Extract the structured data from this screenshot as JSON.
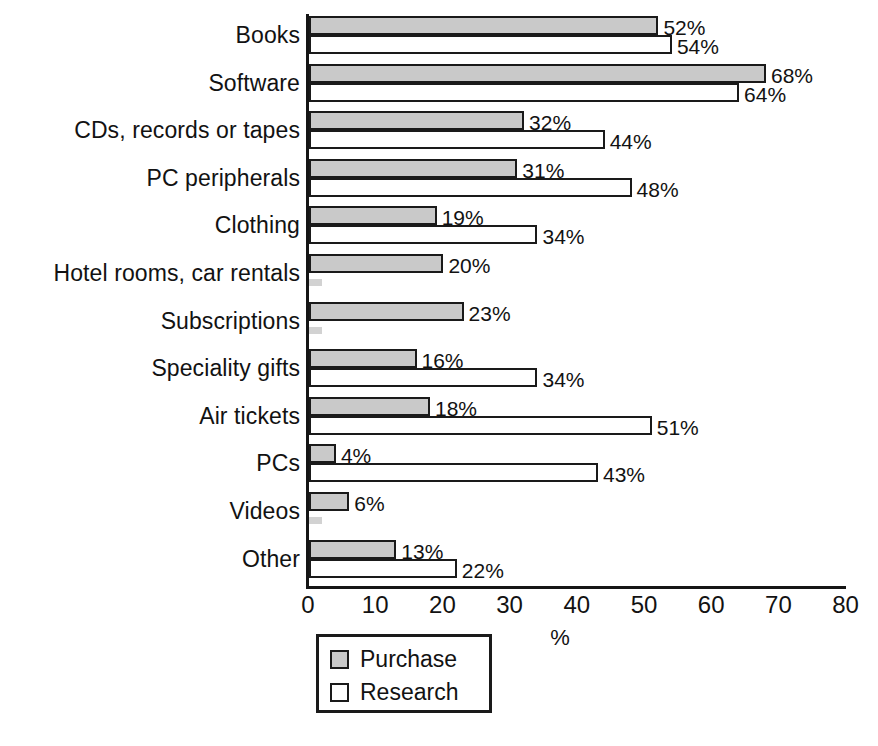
{
  "chart_data": {
    "type": "bar",
    "orientation": "horizontal",
    "title": "",
    "xlabel": "%",
    "ylabel": "",
    "xlim": [
      0,
      80
    ],
    "xticks": [
      "0",
      "10",
      "20",
      "30",
      "40",
      "50",
      "60",
      "70",
      "80"
    ],
    "grid": false,
    "legend_position": "below-axis-left",
    "categories": [
      "Books",
      "Software",
      "CDs, records or tapes",
      "PC peripherals",
      "Clothing",
      "Hotel rooms, car rentals",
      "Subscriptions",
      "Speciality gifts",
      "Air tickets",
      "PCs",
      "Videos",
      "Other"
    ],
    "series": [
      {
        "name": "Purchase",
        "color": "#c9c9c9",
        "values": [
          52,
          68,
          32,
          31,
          19,
          20,
          23,
          16,
          18,
          4,
          6,
          13
        ],
        "labels": [
          "52%",
          "68%",
          "32%",
          "31%",
          "19%",
          "20%",
          "23%",
          "16%",
          "18%",
          "4%",
          "6%",
          "13%"
        ]
      },
      {
        "name": "Research",
        "color": "#ffffff",
        "values": [
          54,
          64,
          44,
          48,
          34,
          2,
          2,
          34,
          51,
          43,
          2,
          22
        ],
        "labels": [
          "54%",
          "64%",
          "44%",
          "48%",
          "34%",
          "",
          "",
          "34%",
          "51%",
          "43%",
          "",
          "22%"
        ]
      }
    ]
  },
  "legend": {
    "items": [
      {
        "label": "Purchase"
      },
      {
        "label": "Research"
      }
    ]
  },
  "axis": {
    "x_title": "%"
  }
}
